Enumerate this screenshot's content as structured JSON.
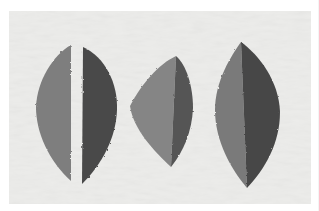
{
  "image": {
    "description": "Grayscale photograph of three paper leaf cut-outs on a light textured background, each split along a vertical midrib into a lighter left half and a darker right half",
    "background_color": "#ececea",
    "border_color": "#ffffff",
    "leaves": [
      {
        "name": "split-leaf",
        "note": "two halves separated by a white gap",
        "light_half": "#7e7e7e",
        "dark_half": "#4a4a4a"
      },
      {
        "name": "short-leaf",
        "note": "broad asymmetric leaf, halves joined",
        "light_half": "#858585",
        "dark_half": "#555555"
      },
      {
        "name": "tall-leaf",
        "note": "tall pointed leaf, halves joined",
        "light_half": "#7a7a7a",
        "dark_half": "#474747"
      }
    ]
  }
}
